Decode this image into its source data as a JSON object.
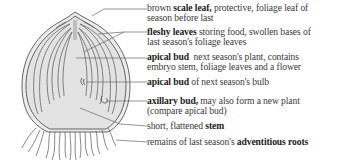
{
  "diagram": {
    "colors": {
      "outline": "#555555",
      "fill": "#e6e6e6",
      "leader": "#666666",
      "text": "#3a3a3a"
    },
    "labels": [
      {
        "id": "scale-leaf",
        "lines": [
          {
            "pre": "brown ",
            "bold": "scale leaf,",
            "post": " protective, foliage leaf of"
          },
          {
            "pre": "season before last",
            "bold": "",
            "post": ""
          }
        ]
      },
      {
        "id": "fleshy-leaves",
        "lines": [
          {
            "pre": "",
            "bold": "fleshy leaves",
            "post": " storing food, swollen bases of"
          },
          {
            "pre": "last season's foliage leaves",
            "bold": "",
            "post": ""
          }
        ]
      },
      {
        "id": "apical-bud-plant",
        "lines": [
          {
            "pre": "",
            "bold": "apical bud",
            "post": "  next season's plant, contains"
          },
          {
            "pre": "embryo stem, foliage leaves and a flower",
            "bold": "",
            "post": ""
          }
        ]
      },
      {
        "id": "apical-bud-bulb",
        "lines": [
          {
            "pre": "",
            "bold": "apical bud",
            "post": " of next season's bulb"
          }
        ]
      },
      {
        "id": "axillary-bud",
        "lines": [
          {
            "pre": "",
            "bold": "axillary bud,",
            "post": " may also form a new plant"
          },
          {
            "pre": "(compare apical bud)",
            "bold": "",
            "post": ""
          }
        ]
      },
      {
        "id": "stem",
        "lines": [
          {
            "pre": "short, flattened ",
            "bold": "stem",
            "post": ""
          }
        ]
      },
      {
        "id": "adventitious-roots",
        "lines": [
          {
            "pre": "remains of last season's ",
            "bold": "adventitious roots",
            "post": ""
          }
        ]
      }
    ]
  }
}
